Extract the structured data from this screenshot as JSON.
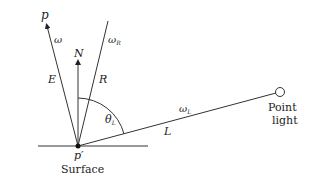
{
  "diagram": {
    "labels": {
      "p": "p",
      "omega": "ω",
      "omega_r": "ω",
      "omega_r_sub": "R",
      "N": "N",
      "E": "E",
      "R": "R",
      "theta": "θ",
      "theta_sub": "L",
      "omega_l": "ω",
      "omega_l_sub": "L",
      "L": "L",
      "p_prime": "p′",
      "surface": "Surface",
      "point_light_1": "Point",
      "point_light_2": "light"
    },
    "colors": {
      "line": "#333333",
      "text": "#222222",
      "background": "#ffffff"
    }
  }
}
